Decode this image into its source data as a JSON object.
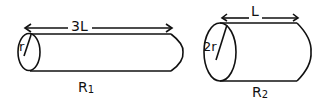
{
  "figure": {
    "cylinder1": {
      "length_label": "3L",
      "radius_label": "r",
      "resistance_label": "R",
      "resistance_sub": "1"
    },
    "cylinder2": {
      "length_label": "L",
      "radius_label": "2r",
      "resistance_label": "R",
      "resistance_sub": "2"
    },
    "stroke_color": "#111111",
    "background": "#ffffff"
  }
}
